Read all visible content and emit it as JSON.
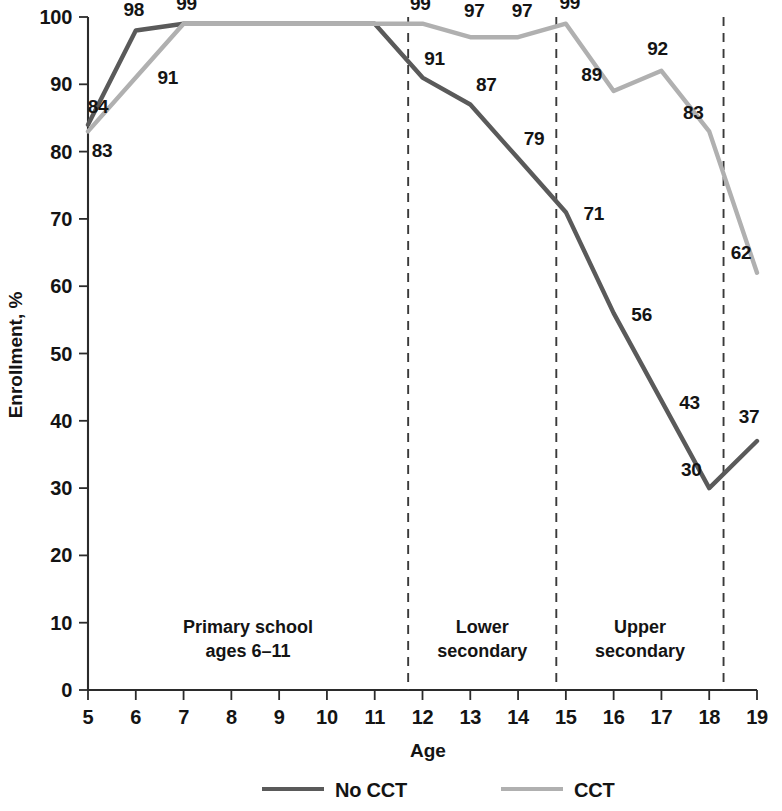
{
  "chart_data": {
    "type": "line",
    "title": "",
    "xlabel": "Age",
    "ylabel": "Enrollment, %",
    "xlim": [
      5,
      19
    ],
    "ylim": [
      0,
      100
    ],
    "grid": false,
    "legend_position": "bottom",
    "x": [
      5,
      6,
      7,
      8,
      9,
      10,
      11,
      12,
      13,
      14,
      15,
      16,
      17,
      18,
      19
    ],
    "xtick_labels": [
      "5",
      "6",
      "7",
      "8",
      "9",
      "10",
      "11",
      "12",
      "13",
      "14",
      "15",
      "16",
      "17",
      "18",
      "19"
    ],
    "ytick_labels": [
      "0",
      "10",
      "20",
      "30",
      "40",
      "50",
      "60",
      "70",
      "80",
      "90",
      "100"
    ],
    "yticks": [
      0,
      10,
      20,
      30,
      40,
      50,
      60,
      70,
      80,
      90,
      100
    ],
    "series": [
      {
        "name": "No CCT",
        "color": "#5a5a5a",
        "values": [
          84,
          98,
          99,
          99,
          99,
          99,
          99,
          91,
          87,
          79,
          71,
          56,
          43,
          30,
          37
        ],
        "labels": [
          {
            "x": 5,
            "y": 84,
            "text": "84",
            "dx": 10,
            "dy": -12
          },
          {
            "x": 6,
            "y": 98,
            "text": "98",
            "dx": -2,
            "dy": -14
          },
          {
            "x": 7,
            "y": 99,
            "text": "99",
            "dx": 3,
            "dy": -14
          },
          {
            "x": 12,
            "y": 91,
            "text": "91",
            "dx": 12,
            "dy": -13
          },
          {
            "x": 13,
            "y": 87,
            "text": "87",
            "dx": 16,
            "dy": -13
          },
          {
            "x": 14,
            "y": 79,
            "text": "79",
            "dx": 16,
            "dy": -13
          },
          {
            "x": 15,
            "y": 71,
            "text": "71",
            "dx": 28,
            "dy": 8
          },
          {
            "x": 16,
            "y": 56,
            "text": "56",
            "dx": 28,
            "dy": 8
          },
          {
            "x": 17,
            "y": 43,
            "text": "43",
            "dx": 28,
            "dy": 8
          },
          {
            "x": 18,
            "y": 30,
            "text": "30",
            "dx": -18,
            "dy": -12
          },
          {
            "x": 19,
            "y": 37,
            "text": "37",
            "dx": -8,
            "dy": -18
          }
        ]
      },
      {
        "name": "CCT",
        "color": "#b0b0b0",
        "values": [
          83,
          91,
          99,
          99,
          99,
          99,
          99,
          99,
          97,
          97,
          99,
          89,
          92,
          83,
          62
        ],
        "labels": [
          {
            "x": 5,
            "y": 83,
            "text": "83",
            "dx": 14,
            "dy": 26
          },
          {
            "x": 6,
            "y": 91,
            "text": "91",
            "dx": 32,
            "dy": 6
          },
          {
            "x": 11.7,
            "y": 99,
            "text": "99",
            "dx": 12,
            "dy": -14
          },
          {
            "x": 13,
            "y": 97,
            "text": "97",
            "dx": 4,
            "dy": -20
          },
          {
            "x": 14,
            "y": 97,
            "text": "97",
            "dx": 4,
            "dy": -20
          },
          {
            "x": 15,
            "y": 99,
            "text": "99",
            "dx": 4,
            "dy": -15
          },
          {
            "x": 16,
            "y": 89,
            "text": "89",
            "dx": -22,
            "dy": -10
          },
          {
            "x": 17,
            "y": 92,
            "text": "92",
            "dx": -4,
            "dy": -16
          },
          {
            "x": 18,
            "y": 83,
            "text": "83",
            "dx": -16,
            "dy": -12
          },
          {
            "x": 19,
            "y": 62,
            "text": "62",
            "dx": -16,
            "dy": -14
          }
        ]
      }
    ],
    "dividers": [
      {
        "x": 11.7
      },
      {
        "x": 14.8
      },
      {
        "x": 18.3
      }
    ],
    "bands": [
      {
        "line1": "Primary school",
        "line2": "ages 6–11",
        "x": 8.35,
        "y": 8.5
      },
      {
        "line1": "Lower",
        "line2": "secondary",
        "x": 13.25,
        "y": 8.5
      },
      {
        "line1": "Upper",
        "line2": "secondary",
        "x": 16.55,
        "y": 8.5
      }
    ],
    "legend": [
      {
        "label": "No CCT",
        "color": "#5a5a5a",
        "width": 4.2
      },
      {
        "label": "CCT",
        "color": "#b0b0b0",
        "width": 4.2
      }
    ]
  }
}
